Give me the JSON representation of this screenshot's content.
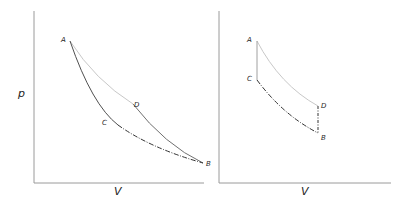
{
  "diagrams": [
    {
      "name": "left-pv-diagram",
      "x_label": "V",
      "y_label": "p",
      "points": {
        "A": "A",
        "B": "B",
        "C": "C",
        "D": "D"
      },
      "curves": [
        {
          "from": "A",
          "to": "D",
          "style": "solid",
          "color": "#c8c8c8"
        },
        {
          "from": "D",
          "to": "B",
          "style": "solid",
          "color": "#707070"
        },
        {
          "from": "A",
          "to": "C",
          "style": "solid",
          "color": "#505050"
        },
        {
          "from": "C",
          "to": "B",
          "style": "dash-dot",
          "color": "#333333"
        }
      ]
    },
    {
      "name": "right-pv-diagram",
      "x_label": "V",
      "points": {
        "A": "A",
        "B": "B",
        "C": "C",
        "D": "D"
      },
      "curves": [
        {
          "from": "A",
          "to": "D",
          "style": "solid",
          "color": "#c8c8c8"
        },
        {
          "from": "A",
          "to": "C",
          "style": "solid",
          "color": "#a0a0a0"
        },
        {
          "from": "C",
          "to": "B",
          "style": "dash-dot",
          "color": "#333333"
        },
        {
          "from": "D",
          "to": "B",
          "style": "dash-dot",
          "color": "#333333"
        }
      ]
    }
  ]
}
